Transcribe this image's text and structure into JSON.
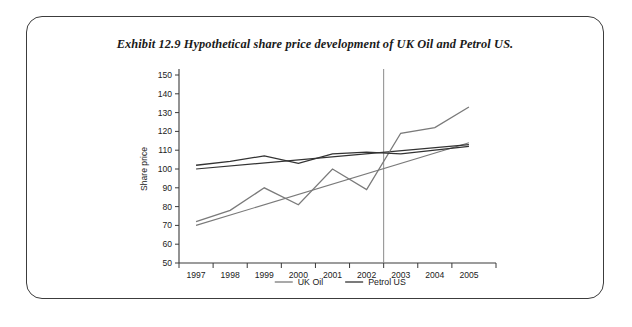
{
  "figure": {
    "title_prefix": "Exhibit 12.9",
    "title_text": "Hypothetical share price development of UK Oil and Petrol US.",
    "title_full": "Exhibit 12.9  Hypothetical share price development of UK Oil and Petrol US."
  },
  "colors": {
    "uk_oil": "#7a7a7a",
    "petrol_us": "#333333",
    "axis": "#3a3a3a",
    "event_line": "#8a8a8a",
    "frame": "#3c3c3c",
    "background": "#ffffff"
  },
  "legend": {
    "position": "bottom-center",
    "entries": [
      {
        "label": "UK Oil",
        "color": "#7a7a7a"
      },
      {
        "label": "Petrol US",
        "color": "#333333"
      }
    ]
  },
  "chart_data": {
    "type": "line",
    "title": "Hypothetical share price development of UK Oil and Petrol US.",
    "xlabel": "",
    "ylabel": "Share price",
    "categories": [
      "1997",
      "1998",
      "1999",
      "2000",
      "2001",
      "2002",
      "2003",
      "2004",
      "2005"
    ],
    "x_tick_labels": [
      "1997",
      "1998",
      "1999",
      "2000",
      "2001",
      "2002",
      "2003",
      "2004",
      "2005"
    ],
    "y_tick_labels": [
      "50",
      "60",
      "70",
      "80",
      "90",
      "100",
      "110",
      "120",
      "130",
      "140",
      "150"
    ],
    "ylim": [
      50,
      150
    ],
    "y_tick_step": 10,
    "grid": false,
    "legend_position": "bottom-center",
    "series": [
      {
        "name": "UK Oil",
        "color": "#7a7a7a",
        "values": [
          72,
          78,
          90,
          81,
          100,
          89,
          119,
          122,
          133
        ]
      },
      {
        "name": "Petrol US",
        "color": "#333333",
        "values": [
          102,
          104,
          107,
          103,
          108,
          109,
          108,
          110,
          112
        ]
      }
    ],
    "trend_lines": [
      {
        "name": "UK Oil trend",
        "color": "#7a7a7a",
        "start": {
          "x": "1997",
          "y": 70
        },
        "end": {
          "x": "2005",
          "y": 114
        }
      },
      {
        "name": "Petrol US trend",
        "color": "#333333",
        "start": {
          "x": "1997",
          "y": 100
        },
        "end": {
          "x": "2005",
          "y": 113
        }
      }
    ],
    "annotations": [
      {
        "type": "vertical-event-line",
        "label": "",
        "x_value": "2002.5",
        "color": "#8a8a8a"
      }
    ]
  }
}
